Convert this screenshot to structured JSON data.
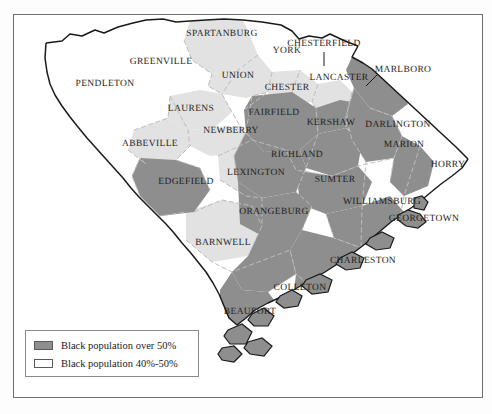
{
  "figure": {
    "frame": {
      "border_color": "#6f6f6f",
      "background": "#ffffff"
    }
  },
  "colors": {
    "over_50": "#8e8e8e",
    "range_40_50": "#e2e2e2",
    "under_40": "#ffffff",
    "county_border": "#b9b9b9",
    "state_border": "#1a1a1a",
    "label_text": "#1d1d1d"
  },
  "legend": {
    "entries": [
      {
        "swatch_color": "#8e8e8e",
        "label": "Black population over 50%"
      },
      {
        "swatch_color": "#ffffff",
        "label": "Black population 40%-50%"
      }
    ]
  },
  "counties": [
    {
      "name": "SPARTANBURG",
      "x": 222,
      "y": 34,
      "class": "range_40_50"
    },
    {
      "name": "YORK",
      "x": 287,
      "y": 51,
      "class": "under_40"
    },
    {
      "name": "CHESTERFIELD",
      "x": 324,
      "y": 44,
      "class": "under_40"
    },
    {
      "name": "GREENVILLE",
      "x": 161,
      "y": 62,
      "class": "under_40"
    },
    {
      "name": "MARLBORO",
      "x": 403,
      "y": 70,
      "class": "over_50"
    },
    {
      "name": "UNION",
      "x": 238,
      "y": 76,
      "class": "range_40_50"
    },
    {
      "name": "CHESTER",
      "x": 287,
      "y": 88,
      "class": "range_40_50"
    },
    {
      "name": "LANCASTER",
      "x": 339,
      "y": 78,
      "class": "range_40_50"
    },
    {
      "name": "PENDLETON",
      "x": 105,
      "y": 84,
      "class": "under_40"
    },
    {
      "name": "FAIRFIELD",
      "x": 274,
      "y": 113,
      "class": "over_50"
    },
    {
      "name": "LAURENS",
      "x": 191,
      "y": 109,
      "class": "range_40_50"
    },
    {
      "name": "KERSHAW",
      "x": 331,
      "y": 123,
      "class": "over_50"
    },
    {
      "name": "DARLINGTON",
      "x": 398,
      "y": 125,
      "class": "over_50"
    },
    {
      "name": "NEWBERRY",
      "x": 231,
      "y": 131,
      "class": "range_40_50"
    },
    {
      "name": "ABBEVILLE",
      "x": 150,
      "y": 144,
      "class": "range_40_50"
    },
    {
      "name": "RICHLAND",
      "x": 297,
      "y": 155,
      "class": "over_50"
    },
    {
      "name": "MARION",
      "x": 404,
      "y": 145,
      "class": "under_40"
    },
    {
      "name": "HORRY",
      "x": 448,
      "y": 165,
      "class": "under_40"
    },
    {
      "name": "LEXINGTON",
      "x": 256,
      "y": 173,
      "class": "range_40_50"
    },
    {
      "name": "SUMTER",
      "x": 335,
      "y": 180,
      "class": "over_50"
    },
    {
      "name": "EDGEFIELD",
      "x": 186,
      "y": 182,
      "class": "over_50"
    },
    {
      "name": "WILLIAMSBURG",
      "x": 382,
      "y": 202,
      "class": "over_50"
    },
    {
      "name": "ORANGEBURG",
      "x": 274,
      "y": 212,
      "class": "over_50"
    },
    {
      "name": "GEORGETOWN",
      "x": 424,
      "y": 219,
      "class": "over_50"
    },
    {
      "name": "BARNWELL",
      "x": 223,
      "y": 243,
      "class": "range_40_50"
    },
    {
      "name": "CHARLESTON",
      "x": 363,
      "y": 261,
      "class": "over_50"
    },
    {
      "name": "COLLETON",
      "x": 300,
      "y": 288,
      "class": "over_50"
    },
    {
      "name": "BEAUFORT",
      "x": 250,
      "y": 312,
      "class": "over_50"
    }
  ]
}
